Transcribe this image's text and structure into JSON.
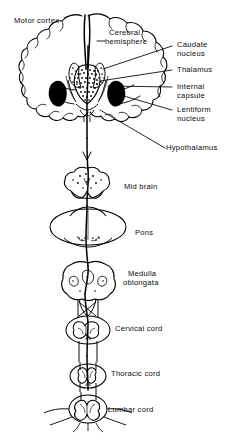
{
  "figure": {
    "ink_color": "#000000",
    "background_color": "#ffffff"
  },
  "labels": {
    "motor_cortex": "Motor cortex",
    "cerebral_hemisphere_line1": "Cerebral",
    "cerebral_hemisphere_line2": "hemisphere",
    "caudate_line1": "Caudate",
    "caudate_line2": "nucleus",
    "thalamus": "Thalamus",
    "internal_capsule_line1": "Internal",
    "internal_capsule_line2": "capsule",
    "lentiform_line1": "Lentiform",
    "lentiform_line2": "nucleus",
    "hypothalamus": "Hypothalamus",
    "mid_brain": "Mid brain",
    "pons": "Pons",
    "medulla_line1": "Medulla",
    "medulla_line2": "oblongata",
    "cervical_cord": "Cervical cord",
    "thoracic_cord": "Thoracic cord",
    "lumbar_cord": "Lumbar cord"
  },
  "structures": [
    {
      "name": "cerebral-hemisphere-coronal-section",
      "label": "Cerebral hemisphere"
    },
    {
      "name": "motor-cortex",
      "label": "Motor cortex"
    },
    {
      "name": "caudate-nucleus",
      "label": "Caudate nucleus"
    },
    {
      "name": "thalamus",
      "label": "Thalamus"
    },
    {
      "name": "internal-capsule",
      "label": "Internal capsule"
    },
    {
      "name": "lentiform-nucleus",
      "label": "Lentiform nucleus"
    },
    {
      "name": "hypothalamus",
      "label": "Hypothalamus"
    },
    {
      "name": "mid-brain",
      "label": "Mid brain"
    },
    {
      "name": "pons",
      "label": "Pons"
    },
    {
      "name": "medulla-oblongata",
      "label": "Medulla oblongata"
    },
    {
      "name": "cervical-cord",
      "label": "Cervical cord"
    },
    {
      "name": "thoracic-cord",
      "label": "Thoracic cord"
    },
    {
      "name": "lumbar-cord",
      "label": "Lumbar cord"
    }
  ]
}
